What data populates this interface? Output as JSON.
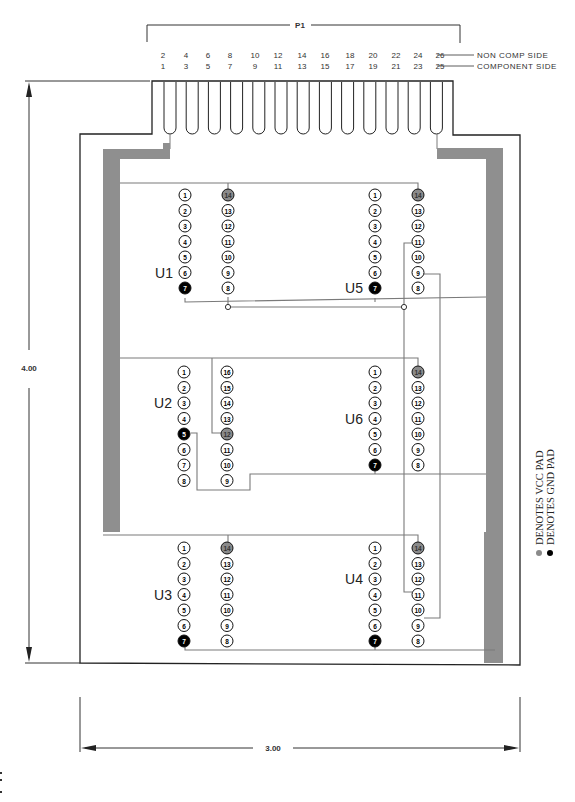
{
  "connector": {
    "label": "P1",
    "even_pins": [
      "2",
      "4",
      "6",
      "8",
      "10",
      "12",
      "14",
      "16",
      "18",
      "20",
      "22",
      "24",
      "26"
    ],
    "odd_pins": [
      "1",
      "3",
      "5",
      "7",
      "9",
      "11",
      "13",
      "15",
      "17",
      "19",
      "21",
      "23",
      "25"
    ],
    "even_side_label": "NON COMP SIDE",
    "odd_side_label": "COMPONENT SIDE",
    "finger_count": 13
  },
  "dimensions": {
    "height": "4.00",
    "width": "3.00"
  },
  "legend": {
    "vcc": "DENOTES VCC PAD",
    "gnd": "DENOTES GND PAD"
  },
  "colors": {
    "vcc_pad": "#8a8a8a",
    "gnd_pad": "#000000",
    "trace": "#7a7a7a",
    "rail": "#8f8f8f",
    "outline": "#222222"
  },
  "chips": [
    {
      "id": "U1",
      "label": "U1",
      "x": 185,
      "y": 195,
      "pins": 14,
      "vcc": 14,
      "gnd": 7,
      "labelSide": "left",
      "labelRow": 5
    },
    {
      "id": "U5",
      "label": "U5",
      "x": 375,
      "y": 195,
      "pins": 14,
      "vcc": 14,
      "gnd": 7,
      "labelSide": "left",
      "labelRow": 6
    },
    {
      "id": "U2",
      "label": "U2",
      "x": 184,
      "y": 372,
      "pins": 16,
      "vcc": 12,
      "gnd": 5,
      "labelSide": "left",
      "labelRow": 2
    },
    {
      "id": "U6",
      "label": "U6",
      "x": 375,
      "y": 372,
      "pins": 14,
      "vcc": 14,
      "gnd": 7,
      "labelSide": "left",
      "labelRow": 3
    },
    {
      "id": "U3",
      "label": "U3",
      "x": 184,
      "y": 548,
      "pins": 14,
      "vcc": 14,
      "gnd": 7,
      "labelSide": "left",
      "labelRow": 3
    },
    {
      "id": "U4",
      "label": "U4",
      "x": 375,
      "y": 548,
      "pins": 14,
      "vcc": 14,
      "gnd": 7,
      "labelSide": "left",
      "labelRow": 2
    }
  ]
}
